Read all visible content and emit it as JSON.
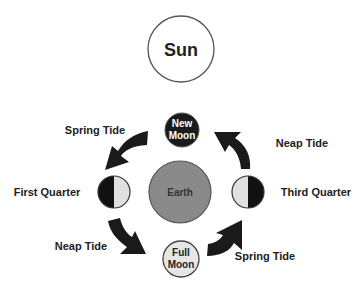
{
  "colors": {
    "outline": "#555555",
    "sun_fill": "#ffffff",
    "new_moon_fill": "#1a1a1a",
    "earth_fill": "#8a8a8a",
    "full_moon_fill": "#e6e6e6",
    "quarter_dark": "#111111",
    "quarter_light": "#e0e0e0",
    "arrow_fill": "#1a1a1a",
    "text": "#222222"
  },
  "bodies": {
    "sun": {
      "label": "Sun"
    },
    "earth": {
      "label": "Earth"
    },
    "new_moon": {
      "line1": "New",
      "line2": "Moon"
    },
    "full_moon": {
      "line1": "Full",
      "line2": "Moon"
    },
    "first_quarter": {
      "label": "First Quarter"
    },
    "third_quarter": {
      "label": "Third Quarter"
    }
  },
  "tides": {
    "top_left": "Spring Tide",
    "top_right": "Neap Tide",
    "bottom_left": "Neap Tide",
    "bottom_right": "Spring Tide"
  }
}
